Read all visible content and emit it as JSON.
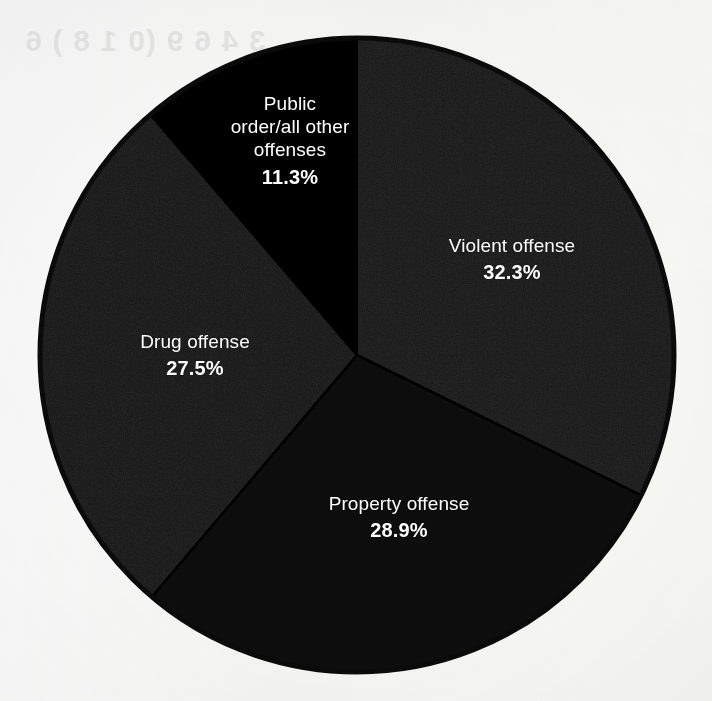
{
  "page": {
    "background_color": "#fbfbfb",
    "ghost_text": "3 4 6 9 (0 1 8 ) 6"
  },
  "chart_data": {
    "type": "pie",
    "title": "",
    "subtitle": "",
    "xlabel": "",
    "ylabel": "",
    "legend_position": "none",
    "grid": false,
    "labels_inside": true,
    "start_angle_deg": 0,
    "direction": "clockwise",
    "center": {
      "x": 357,
      "y": 355
    },
    "radius": 317,
    "outline_color": "#0a0a0a",
    "outline_width": 5,
    "categories": [
      "Violent offense",
      "Property offense",
      "Drug offense",
      "Public order/all other offenses"
    ],
    "values": [
      32.3,
      28.9,
      27.5,
      11.3
    ],
    "value_labels": [
      "32.3%",
      "28.9%",
      "27.5%",
      "11.3%"
    ],
    "colors": [
      "#5b5b5b",
      "#3a3a3a",
      "#5a5a5a",
      "#1c1c1c"
    ],
    "slices": [
      {
        "name": "Violent offense",
        "value": 32.3,
        "value_label": "32.3%",
        "color": "#5b5b5b",
        "label_color": "#ffffff",
        "start_deg": 0.0,
        "end_deg": 116.28
      },
      {
        "name": "Property offense",
        "value": 28.9,
        "value_label": "28.9%",
        "color": "#3a3a3a",
        "label_color": "#ffffff",
        "start_deg": 116.28,
        "end_deg": 220.32
      },
      {
        "name": "Drug offense",
        "value": 27.5,
        "value_label": "27.5%",
        "color": "#5a5a5a",
        "label_color": "#ffffff",
        "start_deg": 220.32,
        "end_deg": 319.32
      },
      {
        "name": "Public order/all other offenses",
        "value": 11.3,
        "value_label": "11.3%",
        "color": "#1c1c1c",
        "label_color": "#ffffff",
        "start_deg": 319.32,
        "end_deg": 360.0
      }
    ]
  },
  "labels": {
    "public_order": {
      "line1": "Public",
      "line2": "order/all other",
      "line3": "offenses",
      "value": "11.3%"
    },
    "violent": {
      "name": "Violent offense",
      "value": "32.3%"
    },
    "drug": {
      "name": "Drug offense",
      "value": "27.5%"
    },
    "property": {
      "name": "Property offense",
      "value": "28.9%"
    }
  }
}
